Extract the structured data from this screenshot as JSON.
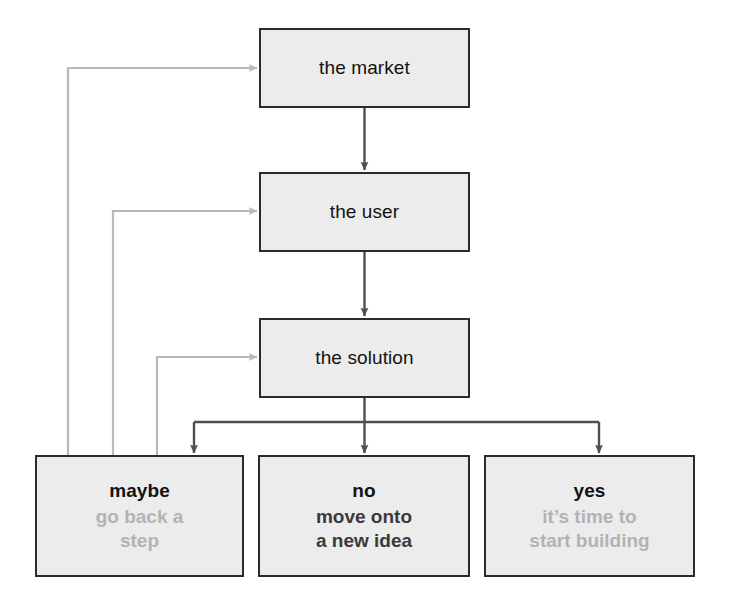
{
  "diagram": {
    "colors": {
      "box_fill": "#ececec",
      "box_border": "#2b2b2b",
      "forward_arrow": "#4f4f4f",
      "feedback_arrow": "#b9b9b9",
      "text_primary": "#121212",
      "text_muted": "#b3b3b3",
      "text_dark_sub": "#3a3a3a",
      "background": "#ffffff"
    },
    "stages": [
      {
        "id": "market",
        "label": "the market"
      },
      {
        "id": "user",
        "label": "the user"
      },
      {
        "id": "solution",
        "label": "the solution"
      }
    ],
    "outcomes": [
      {
        "id": "maybe",
        "label": "maybe",
        "sub_line1": "go back a",
        "sub_line2": "step",
        "sub_style": "muted"
      },
      {
        "id": "no",
        "label": "no",
        "sub_line1": "move onto",
        "sub_line2": "a new idea",
        "sub_style": "dark"
      },
      {
        "id": "yes",
        "label": "yes",
        "sub_line1": "it’s time to",
        "sub_line2": "start building",
        "sub_style": "muted"
      }
    ],
    "connections": [
      {
        "id": "market-to-user",
        "from": "the market",
        "to": "the user",
        "kind": "forward"
      },
      {
        "id": "user-to-solution",
        "from": "the user",
        "to": "the solution",
        "kind": "forward"
      },
      {
        "id": "solution-to-maybe",
        "from": "the solution",
        "to": "maybe",
        "kind": "forward"
      },
      {
        "id": "solution-to-no",
        "from": "the solution",
        "to": "no",
        "kind": "forward"
      },
      {
        "id": "solution-to-yes",
        "from": "the solution",
        "to": "yes",
        "kind": "forward"
      },
      {
        "id": "maybe-to-market",
        "from": "maybe",
        "to": "the market",
        "kind": "feedback"
      },
      {
        "id": "maybe-to-user",
        "from": "maybe",
        "to": "the user",
        "kind": "feedback"
      },
      {
        "id": "maybe-to-solution",
        "from": "maybe",
        "to": "the solution",
        "kind": "feedback"
      }
    ]
  }
}
